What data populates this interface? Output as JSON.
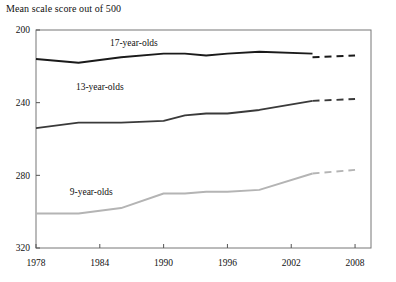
{
  "chart_data": {
    "type": "line",
    "title": "Mean scale score out of 500",
    "xlabel": "",
    "ylabel": "",
    "xlim": [
      1978,
      2009.5
    ],
    "ylim": [
      200,
      320
    ],
    "xticks": [
      1978,
      1984,
      1990,
      1996,
      2002,
      2008
    ],
    "yticks": [
      200,
      240,
      280,
      320
    ],
    "grid": false,
    "legend": "inline-labels",
    "series": [
      {
        "name": "17-year-olds",
        "color": "#1a1a1a",
        "label_x": 1987.2,
        "label_y": 311,
        "solid": {
          "x": [
            1978,
            1982,
            1986,
            1990,
            1992,
            1994,
            1996,
            1999,
            2004
          ],
          "y": [
            304,
            302,
            305,
            307,
            307,
            306,
            307,
            308,
            307
          ]
        },
        "dashed": {
          "x": [
            2004,
            2008
          ],
          "y": [
            305,
            306
          ]
        }
      },
      {
        "name": "13-year-olds",
        "color": "#3a3a3a",
        "label_x": 1984.0,
        "label_y": 287,
        "solid": {
          "x": [
            1978,
            1982,
            1986,
            1990,
            1992,
            1994,
            1996,
            1999,
            2004
          ],
          "y": [
            266,
            269,
            269,
            270,
            273,
            274,
            274,
            276,
            281
          ]
        },
        "dashed": {
          "x": [
            2004,
            2008
          ],
          "y": [
            281,
            282
          ]
        }
      },
      {
        "name": "9-year-olds",
        "color": "#b4b4b4",
        "label_x": 1983.2,
        "label_y": 229,
        "solid": {
          "x": [
            1978,
            1982,
            1986,
            1990,
            1992,
            1994,
            1996,
            1999,
            2004
          ],
          "y": [
            219,
            219,
            222,
            230,
            230,
            231,
            231,
            232,
            241
          ]
        },
        "dashed": {
          "x": [
            2004,
            2008
          ],
          "y": [
            241,
            243
          ]
        }
      }
    ]
  },
  "axes": {
    "y_tick_labels": [
      "320",
      "280",
      "240",
      "200"
    ],
    "x_tick_labels": [
      "1978",
      "1984",
      "1990",
      "1996",
      "2002",
      "2008"
    ]
  },
  "colors": {
    "axis": "#555555",
    "frame": "#777777",
    "text": "#111111",
    "series_17": "#1a1a1a",
    "series_13": "#3a3a3a",
    "series_9": "#b4b4b4"
  }
}
